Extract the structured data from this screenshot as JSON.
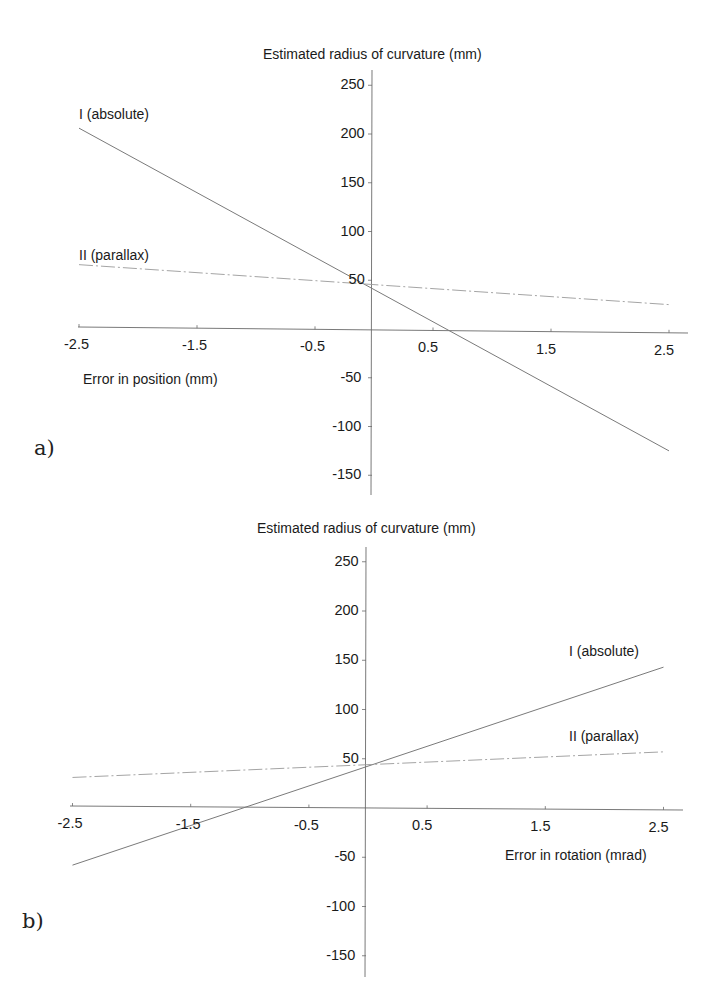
{
  "chart_data": [
    {
      "panel": "a",
      "panel_label": "a)",
      "type": "line",
      "title": "",
      "ylabel": "Estimated radius of curvature (mm)",
      "xlabel": "Error in position (mm)",
      "xlim": [
        -2.5,
        2.5
      ],
      "ylim": [
        -150,
        250
      ],
      "x_ticks": [
        -2.5,
        -1.5,
        -0.5,
        0.5,
        1.5,
        2.5
      ],
      "x_tick_labels": [
        "-2.5",
        "-1.5",
        "-0.5",
        "0.5",
        "1.5",
        "2.5"
      ],
      "y_ticks": [
        250,
        200,
        150,
        100,
        50,
        -50,
        -100,
        -150
      ],
      "y_tick_labels": [
        "250",
        "200",
        "150",
        "100",
        "50",
        "-50",
        "-100",
        "-150"
      ],
      "grid": false,
      "legend": "inline labels at left end of lines",
      "series": [
        {
          "name": "I (absolute)",
          "x": [
            -2.5,
            2.5
          ],
          "values": [
            206,
            -125
          ],
          "style": "solid"
        },
        {
          "name": "II (parallax)",
          "x": [
            -2.5,
            2.5
          ],
          "values": [
            66,
            25
          ],
          "style": "dashed"
        }
      ]
    },
    {
      "panel": "b",
      "panel_label": "b)",
      "type": "line",
      "title": "",
      "ylabel": "Estimated radius of curvature (mm)",
      "xlabel": "Error in rotation (mrad)",
      "xlim": [
        -2.5,
        2.5
      ],
      "ylim": [
        -150,
        250
      ],
      "x_ticks": [
        -2.5,
        -1.5,
        -0.5,
        0.5,
        1.5,
        2.5
      ],
      "x_tick_labels": [
        "-2.5",
        "-1.5",
        "-0.5",
        "0.5",
        "1.5",
        "2.5"
      ],
      "y_ticks": [
        250,
        200,
        150,
        100,
        50,
        -50,
        -100,
        -150
      ],
      "y_tick_labels": [
        "250",
        "200",
        "150",
        "100",
        "50",
        "-50",
        "-100",
        "-150"
      ],
      "grid": false,
      "legend": "inline labels at right end of lines",
      "series": [
        {
          "name": "I (absolute)",
          "x": [
            -2.5,
            2.5
          ],
          "values": [
            -58,
            143
          ],
          "style": "solid"
        },
        {
          "name": "II (parallax)",
          "x": [
            -2.5,
            2.5
          ],
          "values": [
            31,
            57
          ],
          "style": "dashed"
        }
      ]
    }
  ],
  "panels": {
    "a": {
      "letter": "a)",
      "y_title": "Estimated radius of curvature (mm)",
      "x_title": "Error in position (mm)",
      "series_labels": [
        "I (absolute)",
        "II (parallax)"
      ]
    },
    "b": {
      "letter": "b)",
      "y_title": "Estimated radius of curvature (mm)",
      "x_title": "Error in rotation (mrad)",
      "series_labels": [
        "I (absolute)",
        "II (parallax)"
      ]
    }
  },
  "colors": {
    "axis": "#6a6a6a",
    "line_solid": "#7a7a7a",
    "line_dashed": "#9a9a9a",
    "text": "#1a1a1a"
  }
}
